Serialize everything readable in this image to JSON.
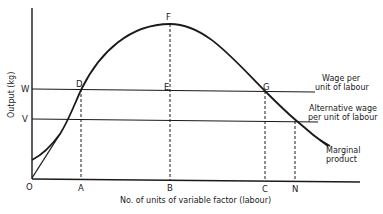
{
  "diagram": {
    "y_axis_label": "Output (kg)",
    "x_axis_label": "No. of units of variable factor (labour)",
    "origin_label": "O",
    "y_ticks": {
      "W": "W",
      "V": "V"
    },
    "x_ticks": {
      "A": "A",
      "B": "B",
      "C": "C",
      "N": "N"
    },
    "points": {
      "D": "D",
      "E": "E",
      "F": "F",
      "G": "G"
    },
    "annotations": {
      "wage_line": [
        "Wage per",
        "unit of labour"
      ],
      "alt_wage_line": [
        "Alternative wage",
        "per unit of labour"
      ],
      "curve": [
        "Marginal",
        "product"
      ]
    },
    "colors": {
      "ink": "#1a1a1a",
      "background": "#ffffff"
    }
  }
}
